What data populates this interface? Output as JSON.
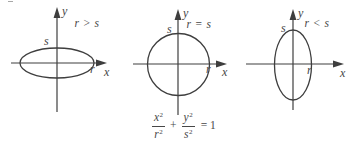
{
  "panels": [
    {
      "shape": "wide-ellipse",
      "relation": "r > s",
      "axis_labels": {
        "x": "x",
        "y": "y"
      },
      "intercept_labels": {
        "x": "r",
        "y": "s"
      }
    },
    {
      "shape": "circle",
      "relation": "r = s",
      "axis_labels": {
        "x": "x",
        "y": "y"
      },
      "intercept_labels": {
        "x": "r",
        "y": "s"
      }
    },
    {
      "shape": "tall-ellipse",
      "relation": "r < s",
      "axis_labels": {
        "x": "x",
        "y": "y"
      },
      "intercept_labels": {
        "x": "r",
        "y": "s"
      }
    }
  ],
  "equation": {
    "frac1": {
      "num_base": "x",
      "num_exp": "2",
      "den_base": "r",
      "den_exp": "2"
    },
    "operator": "+",
    "frac2": {
      "num_base": "y",
      "num_exp": "2",
      "den_base": "s",
      "den_exp": "2"
    },
    "rhs": "= 1"
  },
  "colors": {
    "ink": "#3e3e3e",
    "background": "#ffffff"
  }
}
